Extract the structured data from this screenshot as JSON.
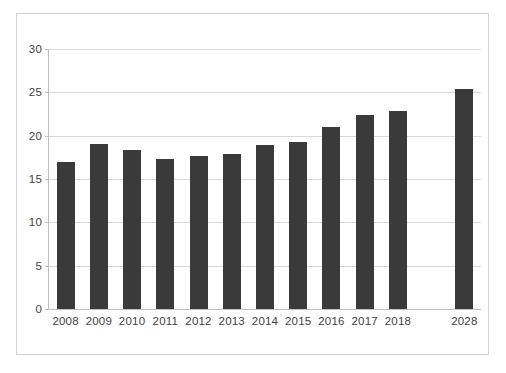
{
  "chart_data": {
    "type": "bar",
    "title": "",
    "subtitle": "",
    "xlabel": "",
    "ylabel": "",
    "categories": [
      "2008",
      "2009",
      "2010",
      "2011",
      "2012",
      "2013",
      "2014",
      "2015",
      "2016",
      "2017",
      "2018",
      "",
      "2028"
    ],
    "values": [
      17.0,
      19.0,
      18.4,
      17.3,
      17.7,
      17.9,
      18.9,
      19.3,
      21.0,
      22.4,
      22.9,
      null,
      25.4
    ],
    "series": [
      {
        "name": "",
        "values": [
          17.0,
          19.0,
          18.4,
          17.3,
          17.7,
          17.9,
          18.9,
          19.3,
          21.0,
          22.4,
          22.9,
          null,
          25.4
        ]
      }
    ],
    "ylim": [
      0,
      30
    ],
    "yticks": [
      0,
      5,
      10,
      15,
      20,
      25,
      30
    ],
    "ytick_labels": [
      "0",
      "5",
      "10",
      "15",
      "20",
      "25",
      "30"
    ],
    "grid": true,
    "grid_axis": "y",
    "legend": false,
    "legend_position": "none",
    "bar_color": "#3a3a3a",
    "grid_color": "#d9d9d9",
    "axis_color": "#bfbfbf",
    "plot_background": "#ffffff",
    "border_color": "#d4d4d4",
    "annotations": []
  }
}
